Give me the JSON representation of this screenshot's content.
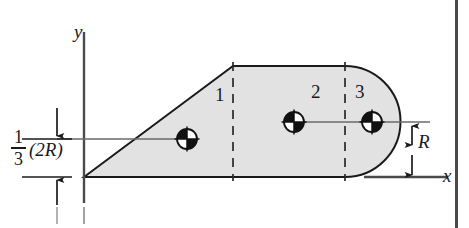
{
  "figure": {
    "background_color": "#ffffff",
    "shape_fill_color": "#e2e2e2",
    "outline_color": "#1a1a1a",
    "border_color": "#4a4a4a"
  },
  "axes": {
    "y_label": "y",
    "x_label": "x",
    "origin": {
      "x": 84,
      "y": 177
    }
  },
  "regions": [
    {
      "id": "1",
      "label": "1",
      "label_x": 215,
      "label_y": 96,
      "kind": "triangle"
    },
    {
      "id": "2",
      "label": "2",
      "label_x": 311,
      "label_y": 93,
      "kind": "rectangle"
    },
    {
      "id": "3",
      "label": "3",
      "label_x": 355,
      "label_y": 93,
      "kind": "semicircle"
    }
  ],
  "dimensions": [
    {
      "id": "height-one-third-2R",
      "numerator": "1",
      "denominator": "3",
      "expression": "(2R)",
      "full_text": "1/3 (2R)"
    },
    {
      "id": "radius-R",
      "label": "R",
      "label_x": 420,
      "label_y": 132
    }
  ],
  "centroids": [
    {
      "id": "centroid-1",
      "cx": 187,
      "cy": 139
    },
    {
      "id": "centroid-2",
      "cx": 294,
      "cy": 122
    },
    {
      "id": "centroid-3",
      "cx": 372,
      "cy": 122
    }
  ],
  "division_lines": [
    {
      "id": "divider-1",
      "x": 233
    },
    {
      "id": "divider-2",
      "x": 345
    }
  ]
}
